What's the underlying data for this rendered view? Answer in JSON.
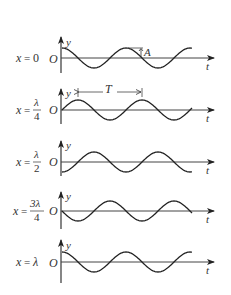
{
  "diagram": {
    "title": "",
    "axis_labels": {
      "y": "y",
      "t": "t",
      "origin": "O"
    },
    "annotations": {
      "amplitude": "A",
      "period": "T"
    },
    "colors": {
      "ink": "#222222",
      "axis": "#444444",
      "background": "#ffffff"
    },
    "panels": [
      {
        "label_lhs": "x",
        "label_eq": "=",
        "label_num": "0",
        "label_den": "",
        "phase": "cos",
        "axis_y": 58
      },
      {
        "label_lhs": "x",
        "label_eq": "=",
        "label_num": "λ",
        "label_den": "4",
        "phase": "sin",
        "axis_y": 110
      },
      {
        "label_lhs": "x",
        "label_eq": "=",
        "label_num": "λ",
        "label_den": "2",
        "phase": "-cos",
        "axis_y": 162
      },
      {
        "label_lhs": "x",
        "label_eq": "=",
        "label_num": "3λ",
        "label_den": "4",
        "phase": "-sin",
        "axis_y": 211
      },
      {
        "label_lhs": "x",
        "label_eq": "=",
        "label_num": "λ",
        "label_den": "",
        "phase": "cos",
        "axis_y": 262
      }
    ]
  }
}
